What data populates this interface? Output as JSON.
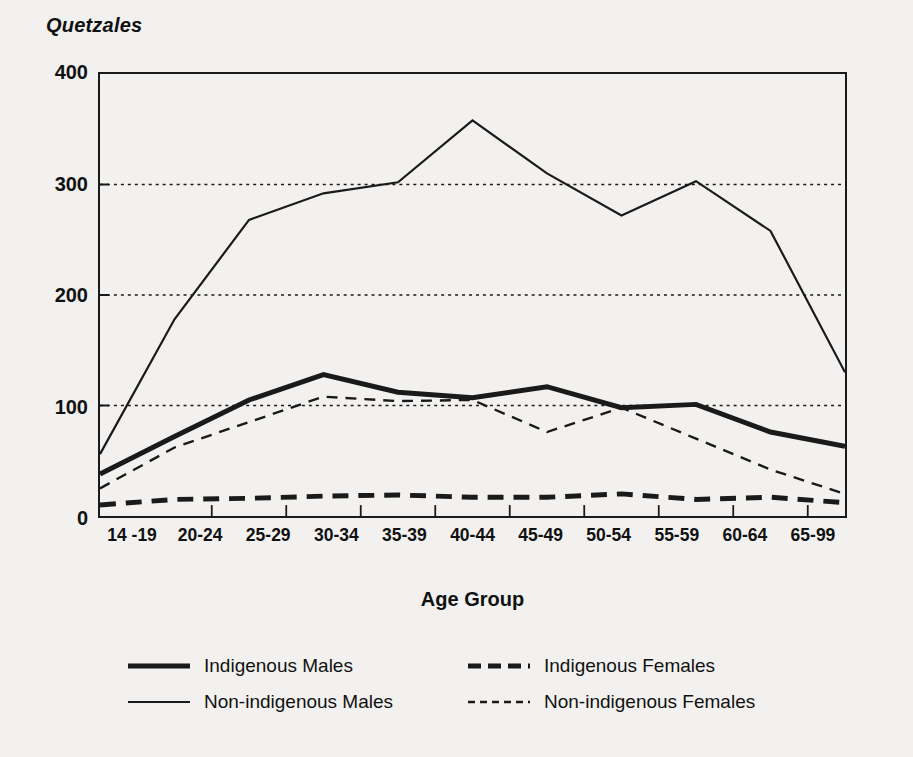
{
  "figure": {
    "y_unit_title": "Quetzales",
    "x_axis_title": "Age Group"
  },
  "axis": {
    "y_ticks": [
      "0",
      "100",
      "200",
      "300",
      "400"
    ],
    "x_ticks": [
      "14 -19",
      "20-24",
      "25-29",
      "30-34",
      "35-39",
      "40-44",
      "45-49",
      "50-54",
      "55-59",
      "60-64",
      "65-99"
    ]
  },
  "legend": {
    "items": [
      {
        "label": "Indigenous Males",
        "style": "thick-solid"
      },
      {
        "label": "Indigenous Females",
        "style": "thick-dashed"
      },
      {
        "label": "Non-indigenous Males",
        "style": "thin-solid"
      },
      {
        "label": "Non-indigenous Females",
        "style": "thin-dashed"
      }
    ]
  },
  "colors": {
    "ink": "#1a1a1a",
    "background": "#f2f1ef",
    "gridline": "#1a1a1a"
  },
  "chart_data": {
    "type": "line",
    "title": "",
    "subtitle": "",
    "xlabel": "Age Group",
    "ylabel": "Quetzales",
    "ylim": [
      0,
      400
    ],
    "yticks": [
      0,
      100,
      200,
      300,
      400
    ],
    "grid": "horizontal-dotted-at-100-200-300",
    "legend_position": "below-plot",
    "categories": [
      "14 -19",
      "20-24",
      "25-29",
      "30-34",
      "35-39",
      "40-44",
      "45-49",
      "50-54",
      "55-59",
      "60-64",
      "65-99"
    ],
    "series": [
      {
        "name": "Indigenous Males",
        "style": "thick-solid",
        "values": [
          38,
          72,
          105,
          128,
          112,
          107,
          117,
          98,
          101,
          76,
          63
        ]
      },
      {
        "name": "Non-indigenous Males",
        "style": "thin-solid",
        "values": [
          56,
          178,
          268,
          292,
          302,
          358,
          310,
          272,
          303,
          258,
          130
        ]
      },
      {
        "name": "Indigenous Females",
        "style": "thick-dashed",
        "values": [
          10,
          15,
          16,
          18,
          19,
          17,
          17,
          20,
          15,
          17,
          12
        ]
      },
      {
        "name": "Non-indigenous Females",
        "style": "thin-dashed",
        "values": [
          25,
          62,
          85,
          108,
          104,
          105,
          76,
          98,
          70,
          42,
          20
        ]
      }
    ]
  }
}
